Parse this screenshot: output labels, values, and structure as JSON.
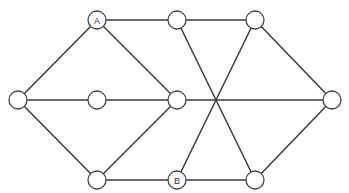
{
  "diagram": {
    "type": "graph",
    "node_radius": 9,
    "colors": {
      "edge": "#3a3a3a",
      "node_stroke": "#444444",
      "node_fill": "#ffffff",
      "label": "#333333"
    },
    "nodes": [
      {
        "id": "A",
        "label": "A",
        "x": 97,
        "y": 20
      },
      {
        "id": "T1",
        "label": "",
        "x": 177,
        "y": 20
      },
      {
        "id": "T2",
        "label": "",
        "x": 255,
        "y": 20
      },
      {
        "id": "L",
        "label": "",
        "x": 18,
        "y": 100
      },
      {
        "id": "M1",
        "label": "",
        "x": 97,
        "y": 100
      },
      {
        "id": "M2",
        "label": "",
        "x": 177,
        "y": 100
      },
      {
        "id": "R",
        "label": "",
        "x": 332,
        "y": 100
      },
      {
        "id": "B1",
        "label": "",
        "x": 97,
        "y": 180
      },
      {
        "id": "B",
        "label": "B",
        "x": 177,
        "y": 180
      },
      {
        "id": "B2",
        "label": "",
        "x": 255,
        "y": 180
      }
    ],
    "edges": [
      [
        "L",
        "A"
      ],
      [
        "A",
        "T1"
      ],
      [
        "A",
        "M2"
      ],
      [
        "T1",
        "T2"
      ],
      [
        "L",
        "M1"
      ],
      [
        "M1",
        "M2"
      ],
      [
        "M2",
        "R"
      ],
      [
        "L",
        "B1"
      ],
      [
        "B1",
        "M2"
      ],
      [
        "B1",
        "B"
      ],
      [
        "T1",
        "B2"
      ],
      [
        "T2",
        "B"
      ],
      [
        "T2",
        "R"
      ],
      [
        "B2",
        "R"
      ],
      [
        "B",
        "B2"
      ]
    ]
  }
}
